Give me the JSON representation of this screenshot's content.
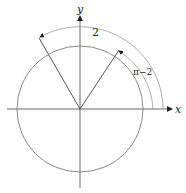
{
  "diagram": {
    "type": "unit-circle-angle",
    "axes": {
      "x_label": "x",
      "y_label": "y"
    },
    "angles": [
      {
        "label": "2",
        "from_deg": 0,
        "to_deg": 120,
        "description": "arc from positive x-axis to terminal ray"
      },
      {
        "label": "π−2",
        "from_deg": 0,
        "to_deg": 60,
        "description": "reference arc from positive x-axis to reflected ray"
      }
    ],
    "colors": {
      "circle": "#888888",
      "lines": "#555555",
      "arcs": "#999999",
      "axes": "#666666"
    }
  }
}
